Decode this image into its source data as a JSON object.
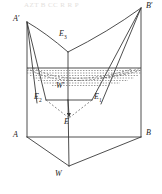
{
  "figure": {
    "type": "line-diagram",
    "width": 162,
    "height": 194,
    "stroke_color": "#3a3a3a",
    "dash_color": "#6b6b6b",
    "background": "#ffffff"
  },
  "labels": {
    "a_prime": {
      "text": "A",
      "prime": "′",
      "x": 13,
      "y": 17
    },
    "b_prime": {
      "text": "B",
      "prime": "′",
      "x": 146,
      "y": 4
    },
    "e3": {
      "text": "E",
      "sub": "3",
      "x": 60,
      "y": 33
    },
    "w_prime": {
      "text": "W",
      "prime": "′",
      "x": 57,
      "y": 84
    },
    "e2": {
      "text": "E",
      "sub": "2",
      "x": 36,
      "y": 95
    },
    "e1": {
      "text": "E",
      "sub": "1",
      "x": 94,
      "y": 95
    },
    "e": {
      "text": "E",
      "x": 65,
      "y": 121
    },
    "a": {
      "text": "A",
      "x": 13,
      "y": 133
    },
    "b": {
      "text": "B",
      "x": 146,
      "y": 131
    },
    "w": {
      "text": "W",
      "x": 55,
      "y": 172
    }
  },
  "points": {
    "A_prime": {
      "x": 27,
      "y": 22
    },
    "B_prime": {
      "x": 141,
      "y": 8
    },
    "A": {
      "x": 27,
      "y": 137
    },
    "B": {
      "x": 141,
      "y": 137
    },
    "W": {
      "x": 69,
      "y": 166
    },
    "E3_vertex": {
      "x": 68,
      "y": 52
    },
    "E2": {
      "x": 46,
      "y": 100
    },
    "E1": {
      "x": 92,
      "y": 100
    },
    "W_prime": {
      "x": 68,
      "y": 100
    },
    "E": {
      "x": 69,
      "y": 118
    }
  },
  "water": {
    "surface_y": 68,
    "left_x": 27,
    "right_x": 141,
    "hatch_rows": 5,
    "label": "water-level-hatching"
  },
  "ghost_text": {
    "top": "AZT B CC R R P",
    "mid": "■■■"
  }
}
